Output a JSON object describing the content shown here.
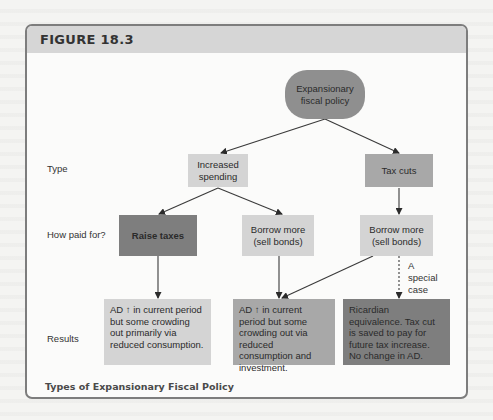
{
  "figure": {
    "label": "FIGURE 18.3",
    "caption": "Types of Expansionary Fiscal Policy"
  },
  "row_labels": {
    "type": "Type",
    "how_paid": "How paid for?",
    "results": "Results"
  },
  "nodes": {
    "root": "Expansionary fiscal policy",
    "increased_spending": "Increased spending",
    "tax_cuts": "Tax cuts",
    "raise_taxes": "Raise taxes",
    "borrow_spending": "Borrow more (sell bonds)",
    "borrow_taxcut": "Borrow more (sell bonds)"
  },
  "special_case_note": "A special case",
  "results": {
    "raise_taxes": "AD ↑ in current period but some crowding out primarily via reduced consumption.",
    "borrow_spending": "AD ↑ in current period but some crowding out via reduced consumption and investment.",
    "ricardian": "Ricardian equivalence. Tax cut is saved to pay for future tax increase. No change in AD."
  },
  "colors": {
    "frame_border": "#7d7d7d",
    "header_band": "#d6d6d6",
    "root_oval": "#8f8f8f",
    "light_box": "#d4d4d4",
    "medium_box": "#a8a8a8",
    "dark_box": "#7e7e7e"
  }
}
